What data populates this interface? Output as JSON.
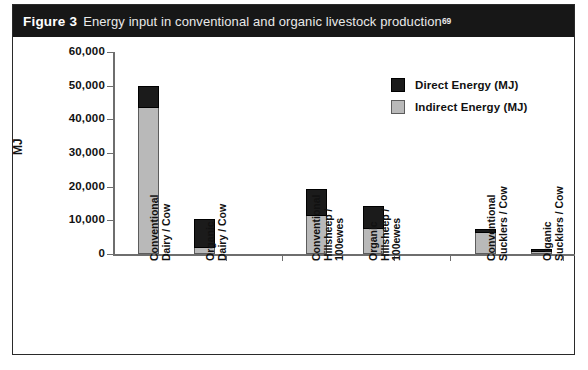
{
  "figure": {
    "label": "Figure 3",
    "caption": "Energy input in conventional and organic livestock production",
    "superscript": "69"
  },
  "colors": {
    "direct": "#1b1b1b",
    "indirect": "#b9b9b9",
    "caption_bar": "#171717",
    "axis": "#6e6e6e",
    "frame": "#2a2a2a"
  },
  "chart_data": {
    "type": "bar",
    "stacked": true,
    "title": "Energy input in conventional and organic livestock production",
    "xlabel": "",
    "ylabel": "MJ",
    "ylim": [
      0,
      60000
    ],
    "yticks": [
      0,
      10000,
      20000,
      30000,
      40000,
      50000,
      60000
    ],
    "ytick_labels": [
      "0",
      "10,000",
      "20,000",
      "30,000",
      "40,000",
      "50,000",
      "60,000"
    ],
    "grid": false,
    "legend_position": "upper right",
    "categories": [
      "Conventional\nDairy / Cow",
      "Organic\nDairy / Cow",
      "Conventional\nHillsheep /\n100ewes",
      "Organic\nHillsheep /\n100ewes",
      "Conventional\nSucklers / Cow",
      "Organic\nSucklers / Cow"
    ],
    "series": [
      {
        "name": "Indirect Energy (MJ)",
        "color": "#b9b9b9",
        "values": [
          43400,
          1800,
          11300,
          7400,
          6200,
          600
        ]
      },
      {
        "name": "Direct Energy (MJ)",
        "color": "#1b1b1b",
        "values": [
          6500,
          8600,
          8000,
          6850,
          1200,
          900
        ]
      }
    ],
    "totals": [
      49900,
      10400,
      19300,
      14250,
      7400,
      1500
    ]
  },
  "legend": {
    "items": [
      {
        "label": "Direct Energy (MJ)",
        "swatch": "direct"
      },
      {
        "label": "Indirect Energy (MJ)",
        "swatch": "indirect"
      }
    ]
  },
  "layout": {
    "bar_left_px": [
      125,
      181,
      293,
      350,
      462,
      518
    ],
    "xtick_left_px": [
      213,
      269,
      381,
      437,
      550
    ],
    "baseline_y_px": 217,
    "px_per_unit": 0.0033667
  }
}
